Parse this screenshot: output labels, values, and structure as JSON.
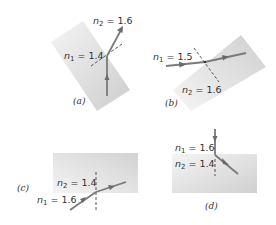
{
  "figure": {
    "colors": {
      "medium_light": "#f2f2f2",
      "medium_dark": "#cfcfcf",
      "ray": "#7a7a7a",
      "normal": "#444444",
      "text": "#333333"
    },
    "panels": [
      {
        "id": "a",
        "caption": "(a)",
        "n1_label": "n",
        "n1_sub": "1",
        "n1_value": " = 1.4",
        "n2_label": "n",
        "n2_sub": "2",
        "n2_value": " = 1.6"
      },
      {
        "id": "b",
        "caption": "(b)",
        "n1_label": "n",
        "n1_sub": "1",
        "n1_value": " = 1.5",
        "n2_label": "n",
        "n2_sub": "2",
        "n2_value": " = 1.6"
      },
      {
        "id": "c",
        "caption": "(c)",
        "n1_label": "n",
        "n1_sub": "1",
        "n1_value": " = 1.6",
        "n2_label": "n",
        "n2_sub": "2",
        "n2_value": " = 1.4"
      },
      {
        "id": "d",
        "caption": "(d)",
        "n1_label": "n",
        "n1_sub": "1",
        "n1_value": " = 1.6",
        "n2_label": "n",
        "n2_sub": "2",
        "n2_value": " = 1.4"
      }
    ]
  }
}
